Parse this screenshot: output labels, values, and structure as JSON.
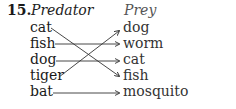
{
  "question": {
    "number": "15.",
    "left_header": "Predator",
    "right_header": "Prey",
    "left_items": [
      "cat",
      "fish",
      "dog",
      "tiger",
      "bat"
    ],
    "right_items": [
      "dog",
      "worm",
      "cat",
      "fish",
      "mosquito"
    ],
    "matches": [
      {
        "from": "cat",
        "to": "fish"
      },
      {
        "from": "fish",
        "to": "worm"
      },
      {
        "from": "dog",
        "to": "cat"
      },
      {
        "from": "tiger",
        "to": "dog"
      },
      {
        "from": "bat",
        "to": "mosquito"
      }
    ]
  }
}
